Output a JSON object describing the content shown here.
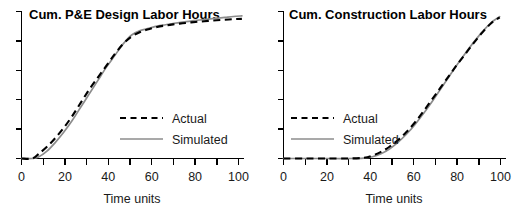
{
  "figure": {
    "panel_count": 2,
    "background_color": "#ffffff"
  },
  "colors": {
    "actual": "#000000",
    "simulated": "#8c8c8c",
    "axis": "#000000",
    "text": "#1a1a1a"
  },
  "chart_data": [
    {
      "type": "line",
      "title": "Cum. P&E Design Labor Hours",
      "xlabel": "Time units",
      "ylabel": "",
      "xlim": [
        0,
        105
      ],
      "ylim": [
        0,
        100
      ],
      "grid": false,
      "legend_position": "inside-lower-right",
      "xticks": [
        0,
        10,
        20,
        30,
        40,
        50,
        60,
        70,
        80,
        90,
        100
      ],
      "xticklabels": [
        "0",
        "",
        "20",
        "",
        "40",
        "",
        "60",
        "",
        "80",
        "",
        "100"
      ],
      "yticks": [
        0,
        20,
        40,
        60,
        80,
        100
      ],
      "yticklabels": [
        "",
        "",
        "",
        "",
        "",
        ""
      ],
      "series": [
        {
          "name": "Actual",
          "style": "dashed",
          "color": "#000000",
          "x": [
            0,
            5,
            8,
            12,
            16,
            20,
            24,
            28,
            32,
            36,
            40,
            44,
            48,
            52,
            56,
            60,
            64,
            68,
            72,
            76,
            80,
            84,
            88,
            92,
            96,
            100,
            104
          ],
          "y": [
            0,
            0,
            3,
            8,
            14,
            21,
            29,
            38,
            47,
            55,
            63,
            71,
            78,
            83,
            86,
            88,
            89.5,
            90.5,
            91.3,
            92,
            92.6,
            93.1,
            93.6,
            94,
            94.4,
            94.8,
            95
          ]
        },
        {
          "name": "Simulated",
          "style": "solid",
          "color": "#8c8c8c",
          "x": [
            0,
            5,
            8,
            12,
            16,
            20,
            24,
            28,
            32,
            36,
            40,
            44,
            48,
            52,
            56,
            60,
            64,
            68,
            72,
            76,
            80,
            84,
            88,
            92,
            96,
            100,
            104
          ],
          "y": [
            0,
            0,
            1,
            5,
            11,
            18,
            26,
            35,
            44,
            53,
            62,
            70,
            78,
            84,
            87,
            88.5,
            90,
            91,
            92,
            92.8,
            93.5,
            94.2,
            94.8,
            95.4,
            96,
            96.6,
            97
          ]
        }
      ]
    },
    {
      "type": "line",
      "title": "Cum. Construction Labor Hours",
      "xlabel": "Time units",
      "ylabel": "",
      "xlim": [
        0,
        105
      ],
      "ylim": [
        0,
        100
      ],
      "grid": false,
      "legend_position": "inside-middle-left",
      "xticks": [
        0,
        10,
        20,
        30,
        40,
        50,
        60,
        70,
        80,
        90,
        100
      ],
      "xticklabels": [
        "0",
        "",
        "20",
        "",
        "40",
        "",
        "60",
        "",
        "80",
        "",
        "100"
      ],
      "yticks": [
        0,
        20,
        40,
        60,
        80,
        100
      ],
      "yticklabels": [
        "",
        "",
        "",
        "",
        "",
        ""
      ],
      "series": [
        {
          "name": "Actual",
          "style": "dashed",
          "color": "#000000",
          "x": [
            0,
            10,
            20,
            30,
            38,
            42,
            46,
            50,
            54,
            58,
            62,
            66,
            70,
            74,
            78,
            82,
            86,
            90,
            94,
            98,
            102
          ],
          "y": [
            0,
            0,
            0,
            0,
            0.5,
            2,
            4.5,
            8,
            12.5,
            18,
            24.5,
            32,
            40,
            48,
            56,
            64,
            71.5,
            79,
            86,
            92,
            96
          ]
        },
        {
          "name": "Simulated",
          "style": "solid",
          "color": "#8c8c8c",
          "x": [
            0,
            10,
            20,
            30,
            38,
            42,
            46,
            50,
            54,
            58,
            62,
            66,
            70,
            74,
            78,
            82,
            86,
            90,
            94,
            98,
            102
          ],
          "y": [
            0,
            0,
            0,
            0,
            0.3,
            1.2,
            3.2,
            6.5,
            11,
            16.5,
            23,
            30.5,
            38.5,
            47,
            55.5,
            64,
            72,
            79.5,
            86.5,
            92.5,
            96.5
          ]
        }
      ]
    }
  ],
  "legend": {
    "actual_label": "Actual",
    "simulated_label": "Simulated"
  }
}
